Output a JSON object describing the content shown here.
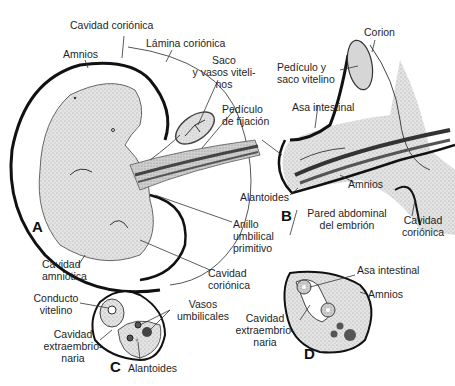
{
  "figure": {
    "panels": {
      "A": {
        "letter": "A",
        "labels": {
          "cavidad_corionica_top": "Cavidad coriónica",
          "lamina_corionica": "Lámina coriónica",
          "amnios": "Amnios",
          "saco_vasos": "Saco\ny vasos viteli-\nnos",
          "pediculo_fijacion": "Pedículo\nde fijación",
          "anillo_umbilical": "Anillo\numbilical\nprimitivo",
          "cavidad_corionica_bottom": "Cavidad\ncoriónica",
          "cavidad_amniotica": "Cavidad\namniótica"
        }
      },
      "B": {
        "letter": "B",
        "labels": {
          "corion": "Corion",
          "pediculo_saco": "Pedículo y\nsaco vitelino",
          "asa_intestinal": "Asa intestinal",
          "alantoides": "Alantoides",
          "amnios": "Amnios",
          "pared_abdominal": "Pared abdominal\ndel embrión",
          "cavidad_corionica": "Cavidad\ncoriónica"
        }
      },
      "C": {
        "letter": "C",
        "labels": {
          "conducto_vitelino": "Conducto\nvitelino",
          "vasos_umbilicales": "Vasos\numbilicales",
          "cavidad_extraembrionaria": "Cavidad\nextraembrio-\nnaria",
          "alantoides": "Alantoides"
        }
      },
      "D": {
        "letter": "D",
        "labels": {
          "asa_intestinal": "Asa intestinal",
          "amnios": "Amnios",
          "cavidad_extraembrionaria": "Cavidad\nextraembrio-\nnaria"
        }
      }
    },
    "colors": {
      "outline": "#111111",
      "tissue_light": "#d9d9d9",
      "tissue_mid": "#bdbdbd",
      "vessel_dark": "#555555",
      "leader": "#333333"
    }
  }
}
